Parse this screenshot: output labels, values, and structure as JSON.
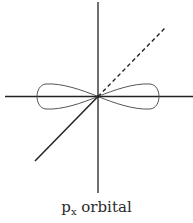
{
  "diagram": {
    "title_main": "p",
    "title_sub": "x",
    "title_rest": " orbital",
    "colors": {
      "axis": "#222222",
      "lobe": "#555555",
      "background": "#ffffff"
    },
    "axes": [
      "x-axis",
      "y-axis",
      "z-axis"
    ],
    "lobes": 2
  }
}
